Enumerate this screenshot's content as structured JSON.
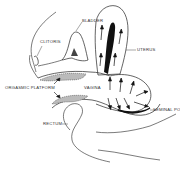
{
  "diagram": {
    "type": "anatomical-cross-section",
    "style": "black-and-white line drawing",
    "labels": {
      "bladder": "BLADDER",
      "clitoris": "CLITORIS",
      "uterus": "UTERUS",
      "orgasmic_platform": "ORGASMIC PLATFORM",
      "vagina": "VAGINA",
      "seminal_pool": "SEMINAL POO",
      "rectum": "RECTUM"
    },
    "colors": {
      "line": "#222222",
      "fill_dark": "#111111",
      "fill_shade": "#bbbbbb",
      "background": "#ffffff"
    }
  }
}
